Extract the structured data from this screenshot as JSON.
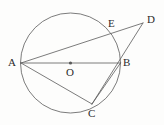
{
  "figure": {
    "kind": "geometry-diagram",
    "width": 164,
    "height": 125,
    "background_color": "#fdfdfc",
    "stroke_color": "#5a5a5a",
    "label_color": "#2b2b2b",
    "stroke_width": 0.8
  },
  "circle": {
    "name": "circle-O",
    "center_x": 70.5,
    "center_y": 63,
    "radius": 50,
    "fill": "none"
  },
  "center_dot": {
    "name": "center-point-O",
    "cx": 70.5,
    "cy": 63,
    "r": 1.6
  },
  "points": [
    {
      "id": "A",
      "label": "A",
      "x": 21,
      "y": 63,
      "label_x": 8,
      "label_y": 57,
      "on_circle": true
    },
    {
      "id": "B",
      "label": "B",
      "x": 120.5,
      "y": 63,
      "label_x": 123,
      "label_y": 57,
      "on_circle": true
    },
    {
      "id": "C",
      "label": "C",
      "x": 92,
      "y": 104,
      "label_x": 88,
      "label_y": 108,
      "on_circle": true
    },
    {
      "id": "D",
      "label": "D",
      "x": 143,
      "y": 23,
      "label_x": 147,
      "label_y": 14,
      "on_circle": false
    },
    {
      "id": "E",
      "label": "E",
      "x": 113,
      "y": 33,
      "label_x": 108,
      "label_y": 18,
      "on_circle": true
    },
    {
      "id": "O",
      "label": "O",
      "x": 70.5,
      "y": 63,
      "label_x": 66,
      "label_y": 67,
      "on_circle": false
    }
  ],
  "segments": [
    {
      "id": "AB",
      "name": "segment-AB-diameter",
      "x1": 21,
      "y1": 63,
      "x2": 120.5,
      "y2": 63
    },
    {
      "id": "AD",
      "name": "segment-AD-secant",
      "x1": 21,
      "y1": 63,
      "x2": 143,
      "y2": 23
    },
    {
      "id": "AC",
      "name": "segment-AC-chord",
      "x1": 21,
      "y1": 63,
      "x2": 92,
      "y2": 104
    },
    {
      "id": "CB",
      "name": "segment-CB-chord",
      "x1": 92,
      "y1": 104,
      "x2": 120.5,
      "y2": 63
    },
    {
      "id": "CD",
      "name": "segment-CD",
      "x1": 92,
      "y1": 104,
      "x2": 143,
      "y2": 23
    }
  ]
}
